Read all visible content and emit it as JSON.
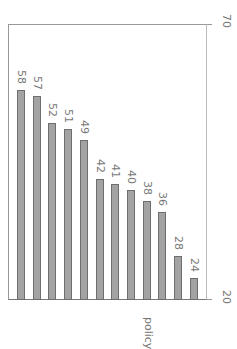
{
  "chart_data": {
    "type": "bar",
    "orientation": "rotated-90",
    "title": "",
    "categories": [
      "",
      "",
      "",
      "",
      "",
      "",
      "",
      "",
      "",
      "",
      "",
      ""
    ],
    "values": [
      58,
      57,
      52,
      51,
      49,
      42,
      41,
      40,
      38,
      36,
      28,
      24
    ],
    "value_labels": [
      "58",
      "57",
      "52",
      "51",
      "49",
      "42",
      "41",
      "40",
      "38",
      "36",
      "28",
      "24"
    ],
    "xlabel": "policy",
    "ylabel": "",
    "ylim": [
      20,
      70
    ],
    "ticks": [
      "20",
      "70"
    ],
    "grid": false,
    "bar_color": "#a3a3a3",
    "bar_edge_color": "#6e6e6e"
  },
  "axis": {
    "min_label": "20",
    "max_label": "70",
    "category_label": "policy"
  }
}
